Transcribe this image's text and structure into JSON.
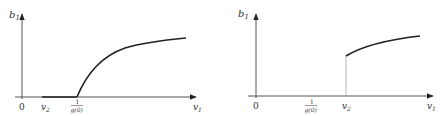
{
  "panels": [
    {
      "id": "left",
      "y_axis_label": "b",
      "y_axis_sub": "1",
      "x_axis_label": "v",
      "x_axis_sub": "1",
      "origin_label": "0",
      "ticks": [
        {
          "main": "v",
          "sub": "2"
        },
        {
          "frac_num": "1",
          "frac_den": "g(0)"
        }
      ],
      "description": "b1 is zero from v2 up to 1/g(0), then rises continuously as a concave curve"
    },
    {
      "id": "right",
      "y_axis_label": "b",
      "y_axis_sub": "1",
      "x_axis_label": "v",
      "x_axis_sub": "1",
      "origin_label": "0",
      "ticks": [
        {
          "frac_num": "1",
          "frac_den": "g(0)"
        },
        {
          "main": "v",
          "sub": "2"
        }
      ],
      "description": "b1 is zero until v2, where it jumps discontinuously and then rises as a concave curve"
    }
  ],
  "colors": {
    "axis": "#555555",
    "curve": "#222222",
    "text": "#333333"
  }
}
